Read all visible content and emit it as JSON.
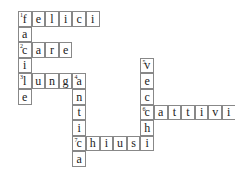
{
  "crossword": {
    "cell_w": 13.6,
    "cell_h": 15.6,
    "words": [
      {
        "number": "1",
        "direction": "across",
        "answer": "felici",
        "row": 0,
        "col": 0
      },
      {
        "number": "1",
        "direction": "down",
        "answer": "facile",
        "row": 0,
        "col": 0
      },
      {
        "number": "2",
        "direction": "across",
        "answer": "care",
        "row": 2,
        "col": 0
      },
      {
        "number": "3",
        "direction": "across",
        "answer": "lunga",
        "row": 4,
        "col": 0
      },
      {
        "number": "4",
        "direction": "down",
        "answer": "antica",
        "row": 4,
        "col": 4
      },
      {
        "number": "5",
        "direction": "down",
        "answer": "vecchi",
        "row": 3,
        "col": 9
      },
      {
        "number": "6",
        "direction": "across",
        "answer": "cattivi",
        "row": 6,
        "col": 9
      },
      {
        "number": "7",
        "direction": "across",
        "answer": "chiusi",
        "row": 8,
        "col": 4
      }
    ]
  }
}
